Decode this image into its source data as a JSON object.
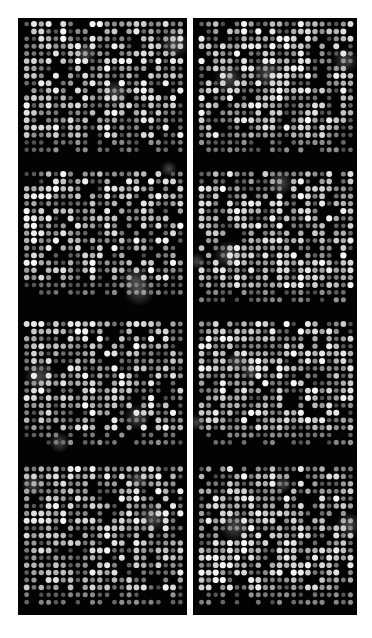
{
  "figure": {
    "background": "#ffffff",
    "panel_color": "#030303",
    "panels": [
      {
        "id": "left",
        "x": 18,
        "y": 18,
        "width": 169,
        "height": 597,
        "blocks": [
          {
            "y": 0,
            "height": 142
          },
          {
            "y": 150,
            "height": 138
          },
          {
            "y": 300,
            "height": 135
          },
          {
            "y": 445,
            "height": 150
          }
        ],
        "columns": 22,
        "rows_per_block": 19,
        "seed": 7
      },
      {
        "id": "right",
        "x": 193,
        "y": 18,
        "width": 164,
        "height": 597,
        "blocks": [
          {
            "y": 0,
            "height": 142
          },
          {
            "y": 150,
            "height": 140
          },
          {
            "y": 300,
            "height": 135
          },
          {
            "y": 445,
            "height": 150
          }
        ],
        "columns": 22,
        "rows_per_block": 19,
        "seed": 13
      }
    ],
    "spot_pitch": 7.4,
    "spot_radius": 2.6
  }
}
